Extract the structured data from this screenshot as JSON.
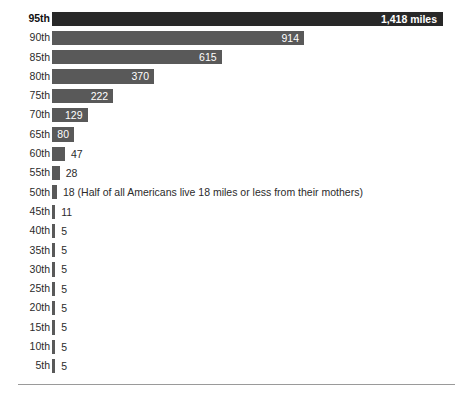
{
  "chart_data": {
    "type": "bar",
    "orientation": "horizontal",
    "title": "",
    "subtitle": "",
    "xlabel": "",
    "ylabel": "",
    "unit": "miles",
    "grid": false,
    "legend": null,
    "xlim": [
      0,
      1418
    ],
    "categories": [
      "95th",
      "90th",
      "85th",
      "80th",
      "75th",
      "70th",
      "65th",
      "60th",
      "55th",
      "50th",
      "45th",
      "40th",
      "35th",
      "30th",
      "25th",
      "20th",
      "15th",
      "10th",
      "5th"
    ],
    "values": [
      1418,
      914,
      615,
      370,
      222,
      129,
      80,
      47,
      28,
      18,
      11,
      5,
      5,
      5,
      5,
      5,
      5,
      5,
      5
    ],
    "value_labels": [
      "1,418 miles",
      "914",
      "615",
      "370",
      "222",
      "129",
      "80",
      "47",
      "28",
      "18",
      "11",
      "5",
      "5",
      "5",
      "5",
      "5",
      "5",
      "5",
      "5"
    ],
    "annotations": [
      {
        "category": "50th",
        "text": "(Half of all Americans live 18 miles or less from their mothers)"
      }
    ],
    "rows": [
      {
        "label": "95th",
        "value": 1418,
        "value_label": "1,418 miles",
        "note": "",
        "label_inside": true,
        "highlight": true
      },
      {
        "label": "90th",
        "value": 914,
        "value_label": "914",
        "note": "",
        "label_inside": true,
        "highlight": false
      },
      {
        "label": "85th",
        "value": 615,
        "value_label": "615",
        "note": "",
        "label_inside": true,
        "highlight": false
      },
      {
        "label": "80th",
        "value": 370,
        "value_label": "370",
        "note": "",
        "label_inside": true,
        "highlight": false
      },
      {
        "label": "75th",
        "value": 222,
        "value_label": "222",
        "note": "",
        "label_inside": true,
        "highlight": false
      },
      {
        "label": "70th",
        "value": 129,
        "value_label": "129",
        "note": "",
        "label_inside": true,
        "highlight": false
      },
      {
        "label": "65th",
        "value": 80,
        "value_label": "80",
        "note": "",
        "label_inside": true,
        "highlight": false
      },
      {
        "label": "60th",
        "value": 47,
        "value_label": "47",
        "note": "",
        "label_inside": false,
        "highlight": false
      },
      {
        "label": "55th",
        "value": 28,
        "value_label": "28",
        "note": "",
        "label_inside": false,
        "highlight": false
      },
      {
        "label": "50th",
        "value": 18,
        "value_label": "18 (Half of all Americans live 18 miles or less from their mothers)",
        "note": "(Half of all Americans live 18 miles or less from their mothers)",
        "label_inside": false,
        "highlight": false
      },
      {
        "label": "45th",
        "value": 11,
        "value_label": "11",
        "note": "",
        "label_inside": false,
        "highlight": false
      },
      {
        "label": "40th",
        "value": 5,
        "value_label": "5",
        "note": "",
        "label_inside": false,
        "highlight": false
      },
      {
        "label": "35th",
        "value": 5,
        "value_label": "5",
        "note": "",
        "label_inside": false,
        "highlight": false
      },
      {
        "label": "30th",
        "value": 5,
        "value_label": "5",
        "note": "",
        "label_inside": false,
        "highlight": false
      },
      {
        "label": "25th",
        "value": 5,
        "value_label": "5",
        "note": "",
        "label_inside": false,
        "highlight": false
      },
      {
        "label": "20th",
        "value": 5,
        "value_label": "5",
        "note": "",
        "label_inside": false,
        "highlight": false
      },
      {
        "label": "15th",
        "value": 5,
        "value_label": "5",
        "note": "",
        "label_inside": false,
        "highlight": false
      },
      {
        "label": "10th",
        "value": 5,
        "value_label": "5",
        "note": "",
        "label_inside": false,
        "highlight": false
      },
      {
        "label": "5th",
        "value": 5,
        "value_label": "5",
        "note": "",
        "label_inside": false,
        "highlight": false
      }
    ]
  },
  "style": {
    "bar_color": "#595959",
    "bar_color_highlight": "#282828",
    "label_color": "#2b2b2b",
    "value_inside_color": "#ffffff",
    "rule_color": "#9a9a9a",
    "background": "#ffffff"
  }
}
